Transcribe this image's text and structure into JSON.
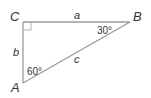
{
  "diagram": {
    "type": "right-triangle",
    "vertices": {
      "C": "C",
      "B": "B",
      "A": "A"
    },
    "sides": {
      "a": "a",
      "b": "b",
      "c": "c"
    },
    "angles": {
      "B": "30°",
      "A": "60°"
    },
    "right_angle_at": "C",
    "line_color": "#999999"
  }
}
